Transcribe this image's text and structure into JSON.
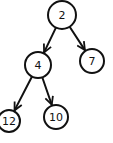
{
  "diagram": {
    "type": "binary-tree",
    "stroke_color": "#111111",
    "background": "#ffffff",
    "nodes": [
      {
        "id": "n2",
        "label": "2",
        "cx": 62,
        "cy": 15,
        "r": 14
      },
      {
        "id": "n4",
        "label": "4",
        "cx": 38,
        "cy": 65,
        "r": 13
      },
      {
        "id": "n7",
        "label": "7",
        "cx": 92,
        "cy": 61,
        "r": 12
      },
      {
        "id": "n12",
        "label": "12",
        "cx": 9,
        "cy": 121,
        "r": 11
      },
      {
        "id": "n10",
        "label": "10",
        "cx": 56,
        "cy": 117,
        "r": 12
      }
    ],
    "edges": [
      {
        "from": "n2",
        "to": "n4"
      },
      {
        "from": "n2",
        "to": "n7"
      },
      {
        "from": "n4",
        "to": "n12"
      },
      {
        "from": "n4",
        "to": "n10"
      }
    ]
  }
}
